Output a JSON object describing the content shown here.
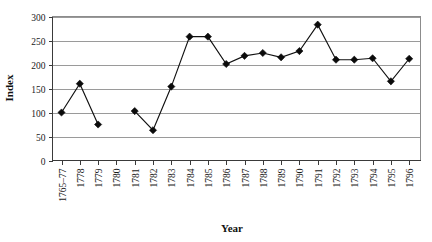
{
  "chart_data": {
    "type": "line",
    "title": "",
    "subtitle": "",
    "xlabel": "Year",
    "ylabel": "Index",
    "categories": [
      "1765–77",
      "1778",
      "1779",
      "1780",
      "1781",
      "1782",
      "1783",
      "1784",
      "1785",
      "1786",
      "1787",
      "1788",
      "1789",
      "1790",
      "1791",
      "1792",
      "1793",
      "1794",
      "1795",
      "1796"
    ],
    "values": [
      100,
      160,
      75,
      null,
      103,
      63,
      154,
      258,
      258,
      201,
      218,
      224,
      215,
      228,
      283,
      210,
      210,
      213,
      165,
      212
    ],
    "series": [
      {
        "name": "Index",
        "values": [
          100,
          160,
          75,
          null,
          103,
          63,
          154,
          258,
          258,
          201,
          218,
          224,
          215,
          228,
          283,
          210,
          210,
          213,
          165,
          212
        ]
      }
    ],
    "ylim": [
      0,
      300
    ],
    "yticks": [
      0,
      50,
      100,
      150,
      200,
      250,
      300
    ],
    "ytick_labels": [
      "0",
      "50",
      "100",
      "150",
      "200",
      "250",
      "300"
    ],
    "grid": "horizontal",
    "legend": "none",
    "marker": "diamond",
    "marker_color": "#0b0b0b",
    "line_color": "#111111",
    "gridline_color": "#9a9a9a",
    "background": "#ffffff",
    "xtick_rotation": -90,
    "annotations": []
  },
  "accessibility": {
    "plot_area_name": "line-plot-area"
  }
}
